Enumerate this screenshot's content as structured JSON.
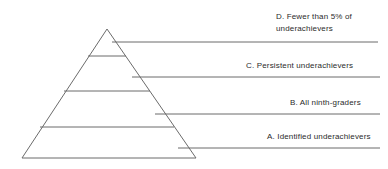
{
  "figure": {
    "type": "pyramid-diagram",
    "background_color": "#ffffff",
    "line_color": "#6b6b6b",
    "text_color": "#2b2b2b",
    "width": 388,
    "height": 169
  },
  "pyramid": {
    "apex": {
      "x": 107,
      "y": 29
    },
    "base_left": {
      "x": 22,
      "y": 158
    },
    "base_right": {
      "x": 196,
      "y": 158
    },
    "divider_y_values": [
      56,
      91,
      127
    ],
    "tier_count": 4
  },
  "callouts": [
    {
      "id": "d",
      "key": "D",
      "label": "D. Fewer than 5% of\nunderachievers",
      "line": {
        "x1": 112,
        "y1": 42,
        "x2": 378,
        "y2": 42
      }
    },
    {
      "id": "c",
      "key": "C",
      "label": "C. Persistent underachievers",
      "line": {
        "x1": 132,
        "y1": 77,
        "x2": 380,
        "y2": 77
      }
    },
    {
      "id": "b",
      "key": "B",
      "label": "B. All ninth-graders",
      "line": {
        "x1": 155,
        "y1": 114,
        "x2": 380,
        "y2": 114
      }
    },
    {
      "id": "a",
      "key": "A",
      "label": "A. Identified underachievers",
      "line": {
        "x1": 178,
        "y1": 148,
        "x2": 380,
        "y2": 148
      }
    }
  ]
}
